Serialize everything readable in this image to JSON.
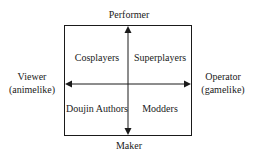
{
  "axes": {
    "top": "Performer",
    "bottom": "Maker",
    "left_line1": "Viewer",
    "left_line2": "(animelike)",
    "right_line1": "Operator",
    "right_line2": "(gamelike)"
  },
  "quadrants": {
    "top_left": "Cosplayers",
    "top_right": "Superplayers",
    "bottom_left": "Doujin Authors",
    "bottom_right": "Modders"
  },
  "colors": {
    "line": "#1a1a1a",
    "background": "#ffffff"
  }
}
